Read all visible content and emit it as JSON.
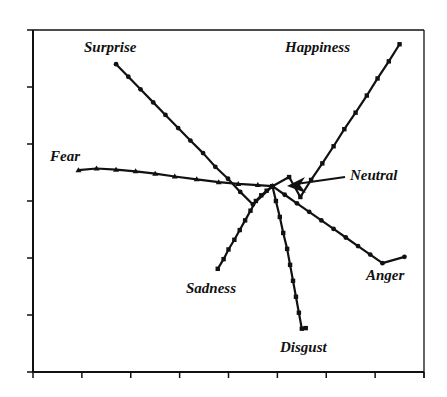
{
  "chart_data": {
    "type": "line",
    "title": "",
    "xlabel": "",
    "ylabel": "",
    "xlim": [
      0,
      8
    ],
    "ylim": [
      0,
      6
    ],
    "x_ticks": [
      0,
      1,
      2,
      3,
      4,
      5,
      6,
      7,
      8
    ],
    "y_ticks": [
      0,
      1,
      2,
      3,
      4,
      5,
      6
    ],
    "tick_labels_shown": false,
    "grid": false,
    "legend": "none (direct labels)",
    "origin_label": "Neutral",
    "neutral_point": {
      "x": 4.9,
      "y": 3.26
    },
    "series": [
      {
        "name": "Surprise",
        "marker": "dot",
        "points": [
          [
            1.7,
            5.4
          ],
          [
            1.95,
            5.18
          ],
          [
            2.2,
            4.96
          ],
          [
            2.46,
            4.73
          ],
          [
            2.71,
            4.51
          ],
          [
            2.97,
            4.28
          ],
          [
            3.22,
            4.06
          ],
          [
            3.48,
            3.84
          ],
          [
            3.73,
            3.6
          ],
          [
            3.99,
            3.39
          ],
          [
            4.24,
            3.16
          ],
          [
            4.5,
            2.94
          ],
          [
            4.9,
            3.26
          ]
        ]
      },
      {
        "name": "Happiness",
        "marker": "square",
        "points": [
          [
            7.5,
            5.75
          ],
          [
            7.28,
            5.45
          ],
          [
            7.05,
            5.15
          ],
          [
            6.83,
            4.85
          ],
          [
            6.6,
            4.55
          ],
          [
            6.37,
            4.26
          ],
          [
            6.15,
            3.96
          ],
          [
            5.92,
            3.66
          ],
          [
            5.69,
            3.37
          ],
          [
            5.47,
            3.07
          ],
          [
            5.24,
            3.42
          ],
          [
            4.9,
            3.26
          ]
        ]
      },
      {
        "name": "Fear",
        "marker": "triangle",
        "points": [
          [
            0.93,
            3.54
          ],
          [
            1.3,
            3.57
          ],
          [
            1.7,
            3.55
          ],
          [
            2.1,
            3.52
          ],
          [
            2.5,
            3.48
          ],
          [
            2.9,
            3.43
          ],
          [
            3.35,
            3.38
          ],
          [
            3.8,
            3.33
          ],
          [
            4.2,
            3.3
          ],
          [
            4.6,
            3.28
          ],
          [
            4.9,
            3.26
          ]
        ]
      },
      {
        "name": "Sadness",
        "marker": "square",
        "points": [
          [
            3.78,
            1.81
          ],
          [
            3.9,
            1.98
          ],
          [
            4.0,
            2.15
          ],
          [
            4.12,
            2.32
          ],
          [
            4.23,
            2.49
          ],
          [
            4.34,
            2.66
          ],
          [
            4.45,
            2.83
          ],
          [
            4.56,
            3.0
          ],
          [
            4.67,
            3.1
          ],
          [
            4.78,
            3.18
          ],
          [
            4.9,
            3.26
          ]
        ]
      },
      {
        "name": "Anger",
        "marker": "dot",
        "points": [
          [
            4.9,
            3.26
          ],
          [
            5.15,
            3.11
          ],
          [
            5.4,
            2.96
          ],
          [
            5.65,
            2.81
          ],
          [
            5.9,
            2.66
          ],
          [
            6.15,
            2.51
          ],
          [
            6.4,
            2.36
          ],
          [
            6.65,
            2.21
          ],
          [
            6.9,
            2.06
          ],
          [
            7.15,
            1.91
          ],
          [
            7.6,
            2.02
          ]
        ]
      },
      {
        "name": "Disgust",
        "marker": "square",
        "points": [
          [
            4.9,
            3.26
          ],
          [
            4.97,
            3.0
          ],
          [
            5.05,
            2.72
          ],
          [
            5.12,
            2.44
          ],
          [
            5.2,
            2.16
          ],
          [
            5.26,
            1.88
          ],
          [
            5.32,
            1.6
          ],
          [
            5.38,
            1.32
          ],
          [
            5.44,
            1.04
          ],
          [
            5.5,
            0.76
          ],
          [
            5.58,
            0.77
          ]
        ]
      }
    ],
    "annotations": [
      {
        "text": "Surprise",
        "x": 1.6,
        "y": 5.75
      },
      {
        "text": "Happiness",
        "x": 6.1,
        "y": 5.75
      },
      {
        "text": "Fear",
        "x": 0.3,
        "y": 3.75
      },
      {
        "text": "Neutral",
        "x": 7.0,
        "y": 3.55,
        "arrow_to": [
          5.15,
          3.3
        ]
      },
      {
        "text": "Sadness",
        "x": 3.2,
        "y": 1.5
      },
      {
        "text": "Anger",
        "x": 7.2,
        "y": 1.55
      },
      {
        "text": "Disgust",
        "x": 5.1,
        "y": 0.35
      }
    ]
  },
  "labels": {
    "surprise": "Surprise",
    "happiness": "Happiness",
    "fear": "Fear",
    "neutral": "Neutral",
    "sadness": "Sadness",
    "anger": "Anger",
    "disgust": "Disgust"
  },
  "colors": {
    "ink": "#111111",
    "background": "#ffffff"
  }
}
